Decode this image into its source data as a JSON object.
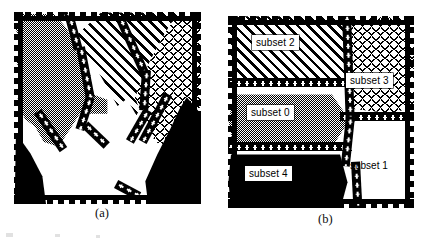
{
  "figure": {
    "kind": "two-panel region partition diagram",
    "panels": [
      {
        "id": "a",
        "caption": "(a)",
        "description": "unlabeled partition of the domain into five textured subsets",
        "regions": [
          {
            "name": "region-gray",
            "fill": "gray-stipple",
            "label": ""
          },
          {
            "name": "region-diag",
            "fill": "diagonal-hatch",
            "label": ""
          },
          {
            "name": "region-cross",
            "fill": "cross-dash",
            "label": ""
          },
          {
            "name": "region-black-left",
            "fill": "solid-black",
            "label": ""
          },
          {
            "name": "region-black-right",
            "fill": "solid-black",
            "label": ""
          },
          {
            "name": "region-white",
            "fill": "solid-white",
            "label": ""
          }
        ]
      },
      {
        "id": "b",
        "caption": "(b)",
        "description": "same partition with each subset named",
        "regions": [
          {
            "name": "region-subset-2",
            "fill": "diagonal-hatch",
            "label": "subset 2"
          },
          {
            "name": "region-subset-3",
            "fill": "cross-dash",
            "label": "subset 3"
          },
          {
            "name": "region-subset-0",
            "fill": "gray-stipple",
            "label": "subset 0"
          },
          {
            "name": "region-subset-4",
            "fill": "solid-black",
            "label": "subset 4"
          },
          {
            "name": "region-subset-1",
            "fill": "solid-white",
            "label": "subset 1"
          }
        ]
      }
    ],
    "colors": {
      "ink": "#000000",
      "paper": "#ffffff",
      "stipple_gray": "#808080"
    }
  }
}
